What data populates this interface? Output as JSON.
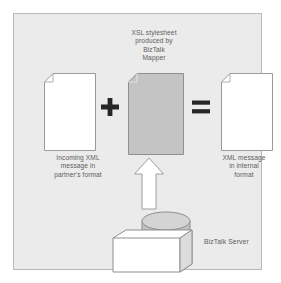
{
  "diagram": {
    "title": "XSL stylesheet\nproduced by\nBizTalk\nMapper",
    "captions": {
      "incoming": "Incoming XML\nmessage in\npartner's format",
      "internal": "XML message\nin internal\nformat",
      "server": "BizTalk Server"
    },
    "operators": {
      "plus": "+",
      "equals": "="
    },
    "shapes": {
      "incoming_document": "document-sheet",
      "xsl_document": "document-sheet-shaded",
      "output_document": "document-sheet",
      "arrow": "arrow-up",
      "database": "cylinder",
      "server_box": "box-3d"
    },
    "colors": {
      "canvas_background": "#ebebeb",
      "frame_border": "#b9b9b9",
      "document_fill": "#ffffff",
      "document_border": "#9a9a9a",
      "shaded_document_fill": "#c4c4c4",
      "operator": "#1c1c1c",
      "caption_text": "#5d5d5d",
      "cylinder_fill": "#c0c0c0",
      "cylinder_top": "#d2d2d2",
      "box_fill": "#ffffff",
      "box_side": "#d8d8d8"
    }
  }
}
